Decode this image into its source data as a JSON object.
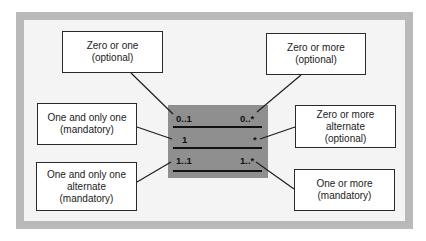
{
  "diagram": {
    "title": "",
    "cardinality_rows": [
      {
        "left": "0..1",
        "right": "0..*"
      },
      {
        "left": "1",
        "right": "*"
      },
      {
        "left": "1..1",
        "right": "1..*"
      }
    ],
    "callouts": {
      "zero_or_one": {
        "line1": "Zero or one",
        "line2": "(optional)",
        "line3": ""
      },
      "one_and_only_one": {
        "line1": "One and only one",
        "line2": "(mandatory)",
        "line3": ""
      },
      "one_alternate": {
        "line1": "One and only one",
        "line2": "alternate",
        "line3": "(mandatory)"
      },
      "zero_or_more": {
        "line1": "Zero or more",
        "line2": "(optional)",
        "line3": ""
      },
      "zero_more_alt": {
        "line1": "Zero or more",
        "line2": "alternate",
        "line3": "(optional)"
      },
      "one_or_more": {
        "line1": "One or more",
        "line2": "(mandatory)",
        "line3": ""
      }
    },
    "colors": {
      "frame": "#b9b9b9",
      "background": "#f4f4f4",
      "panel": "#8f8f8f",
      "stroke": "#2a2a2a"
    }
  }
}
